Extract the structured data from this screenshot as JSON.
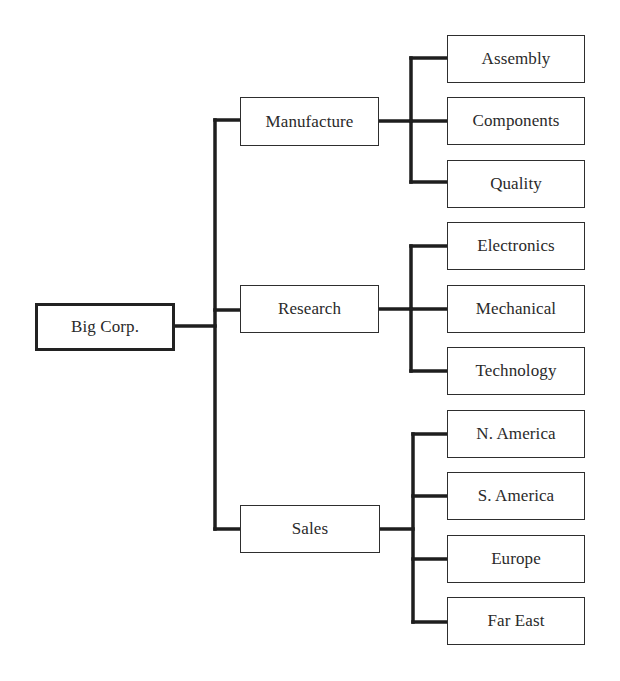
{
  "diagram": {
    "type": "organization-chart",
    "root": {
      "label": "Big Corp.",
      "box": {
        "x": 35,
        "y": 303,
        "w": 140,
        "h": 48
      }
    },
    "divisions": [
      {
        "label": "Manufacture",
        "box": {
          "x": 240,
          "y": 97,
          "w": 139,
          "h": 49
        },
        "children": [
          {
            "label": "Assembly",
            "box": {
              "x": 447,
              "y": 35,
              "w": 138,
              "h": 48
            }
          },
          {
            "label": "Components",
            "box": {
              "x": 447,
              "y": 97,
              "w": 138,
              "h": 48
            }
          },
          {
            "label": "Quality",
            "box": {
              "x": 447,
              "y": 160,
              "w": 138,
              "h": 48
            }
          }
        ]
      },
      {
        "label": "Research",
        "box": {
          "x": 240,
          "y": 285,
          "w": 139,
          "h": 48
        },
        "children": [
          {
            "label": "Electronics",
            "box": {
              "x": 447,
              "y": 222,
              "w": 138,
              "h": 48
            }
          },
          {
            "label": "Mechanical",
            "box": {
              "x": 447,
              "y": 285,
              "w": 138,
              "h": 48
            }
          },
          {
            "label": "Technology",
            "box": {
              "x": 447,
              "y": 347,
              "w": 138,
              "h": 48
            }
          }
        ]
      },
      {
        "label": "Sales",
        "box": {
          "x": 240,
          "y": 505,
          "w": 140,
          "h": 48
        },
        "children": [
          {
            "label": "N. America",
            "box": {
              "x": 447,
              "y": 410,
              "w": 138,
              "h": 48
            }
          },
          {
            "label": "S. America",
            "box": {
              "x": 447,
              "y": 472,
              "w": 138,
              "h": 48
            }
          },
          {
            "label": "Europe",
            "box": {
              "x": 447,
              "y": 535,
              "w": 138,
              "h": 48
            }
          },
          {
            "label": "Far East",
            "box": {
              "x": 447,
              "y": 597,
              "w": 138,
              "h": 48
            }
          }
        ]
      }
    ],
    "colors": {
      "line": "#1e1e1e",
      "border": "#2e2e2e",
      "text": "#2a2a2a",
      "background": "#ffffff"
    }
  }
}
